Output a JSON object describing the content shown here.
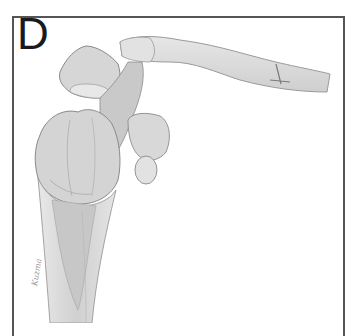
{
  "figure": {
    "panel_label": "D",
    "signature": "Kuzma",
    "colors": {
      "frame": "#555555",
      "bone_fill": "#d9d9d9",
      "bone_shade": "#bdbdbd",
      "bone_light": "#ebebeb",
      "outline": "#8a8a8a",
      "background": "#ffffff"
    }
  }
}
